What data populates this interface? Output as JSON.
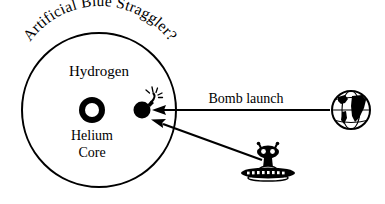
{
  "figure": {
    "background_color": "#ffffff",
    "ink_color": "#000000",
    "title_arc": "Artificial Blue Straggler?",
    "star": {
      "envelope_label": "Hydrogen",
      "core_label_line1": "Helium",
      "core_label_line2": "Core"
    },
    "annotations": {
      "bomb_launch": "Bomb launch"
    },
    "icons": {
      "bomb": "bomb-icon",
      "earth": "earth-globe-icon",
      "alien": "alien-ufo-icon"
    },
    "arrows": [
      {
        "name": "earth-to-bomb-arrow",
        "from": "earth-globe-icon",
        "to": "bomb-icon",
        "label": "Bomb launch"
      },
      {
        "name": "alien-to-bomb-arrow",
        "from": "alien-ufo-icon",
        "to": "bomb-icon",
        "label": ""
      }
    ]
  }
}
